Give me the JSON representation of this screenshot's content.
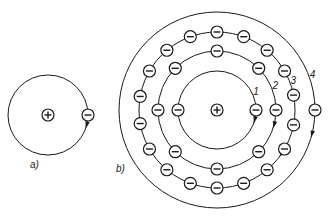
{
  "figure": {
    "panel_a": {
      "label": "a)",
      "center": [
        48,
        115
      ],
      "orbit_radius": 40,
      "nucleus": {
        "symbol": "+",
        "icon": "plus-nucleus-icon"
      },
      "electrons": [
        {
          "angle": 0,
          "arrow": true
        }
      ]
    },
    "panel_b": {
      "label": "b)",
      "center": [
        217,
        110
      ],
      "nucleus": {
        "symbol": "+",
        "icon": "plus-nucleus-icon"
      },
      "orbits": [
        {
          "label": "1",
          "radius": 39,
          "electron_angles": [
            0,
            180
          ],
          "arrow_angle": 0
        },
        {
          "label": "2",
          "radius": 59,
          "electron_angles": [
            0,
            45,
            90,
            135,
            180,
            225,
            270,
            315
          ],
          "arrow_angle": 0
        },
        {
          "label": "3",
          "radius": 78,
          "electron_angles": [
            -11,
            11,
            30,
            50,
            70,
            90,
            110,
            130,
            150,
            170,
            190,
            210,
            230,
            250,
            270,
            290,
            310,
            330
          ],
          "arrow_angle": 20
        },
        {
          "label": "4",
          "radius": 98,
          "electron_angles": [
            0
          ],
          "arrow_angle": 0
        }
      ]
    }
  }
}
